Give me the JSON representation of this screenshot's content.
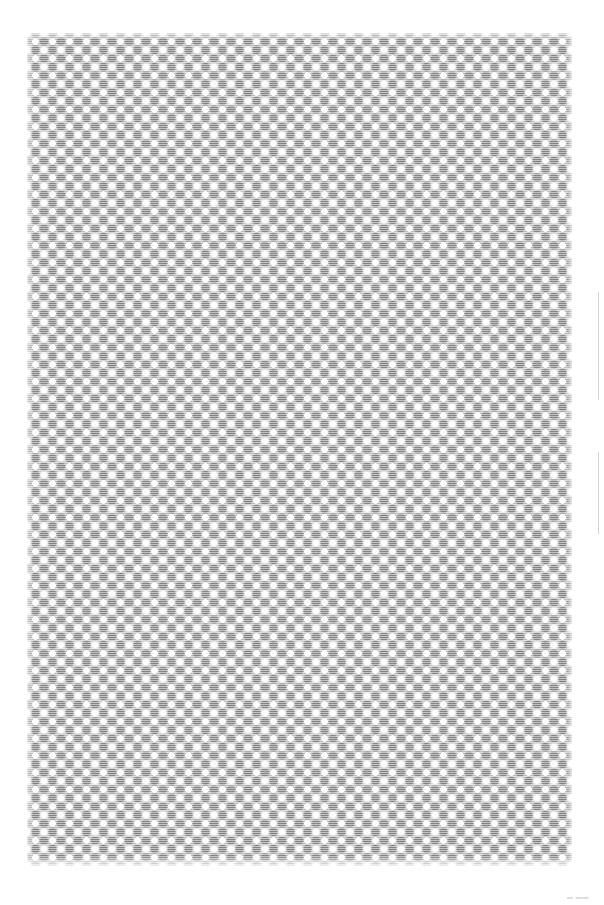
{
  "page": {
    "background_color": "#ffffff",
    "width": 604,
    "height": 905
  },
  "swatch": {
    "name": "halftone-diamond-pattern",
    "description": "Dithered argyle halftone fill swatch",
    "x": 27,
    "y": 33,
    "width": 545,
    "height": 833,
    "tile_size_px": 17,
    "colors": {
      "field": "#e9e9e9",
      "dot": "#ffffff",
      "node": "#787878",
      "wash": "#a0a0a0"
    }
  },
  "scrollbar": {
    "name": "vertical-scrollbar",
    "color": "#d6d6d6",
    "segments": [
      {
        "label": "track-upper",
        "top": 292,
        "height": 108
      },
      {
        "label": "thumb-lower",
        "top": 452,
        "height": 82
      }
    ]
  },
  "corner_mark": {
    "text": "· ▬ ▬▬",
    "color": "#dcdcdc"
  }
}
